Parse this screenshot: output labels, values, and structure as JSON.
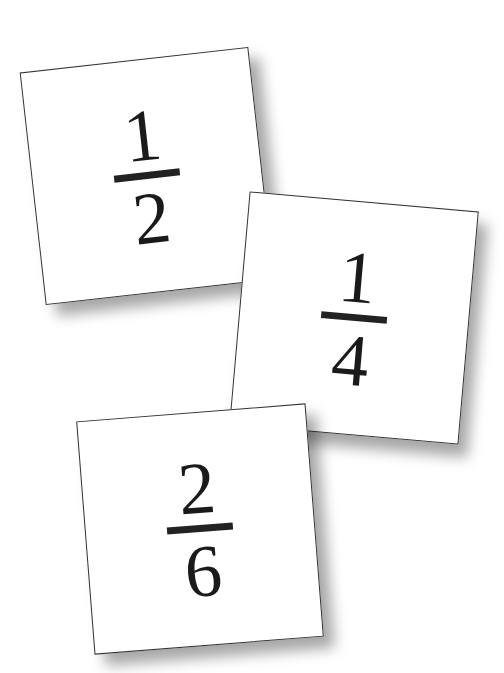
{
  "cards": [
    {
      "numerator": "1",
      "denominator": "2",
      "center": [
        147,
        176
      ],
      "rotation_deg": -6.4
    },
    {
      "numerator": "1",
      "denominator": "4",
      "center": [
        354,
        318
      ],
      "rotation_deg": 5.0
    },
    {
      "numerator": "2",
      "denominator": "6",
      "center": [
        200,
        529
      ],
      "rotation_deg": -4.5
    }
  ]
}
